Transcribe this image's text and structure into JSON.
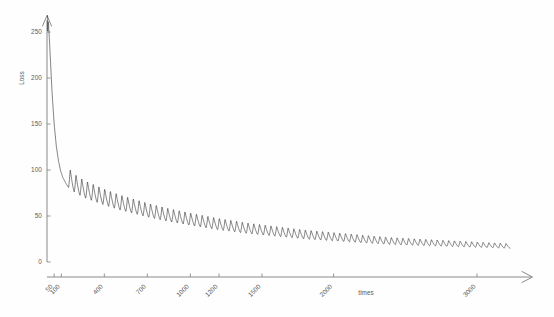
{
  "chart_data": {
    "type": "line",
    "title": "",
    "xlabel": "times",
    "ylabel": "Loss",
    "xlim": [
      0,
      3300
    ],
    "ylim": [
      0,
      262
    ],
    "grid": false,
    "legend": null,
    "series_name": "training loss",
    "line_color": "#2b2b2b",
    "x_ticks": [
      50,
      100,
      400,
      700,
      1000,
      1200,
      1500,
      2000,
      3000
    ],
    "x_tick_labels": [
      "50",
      "100",
      "400",
      "700",
      "1000",
      "1200",
      "1500",
      "2000",
      "3000"
    ],
    "y_ticks": [
      0,
      50,
      100,
      150,
      200,
      250
    ],
    "y_tick_labels": [
      "0",
      "50",
      "100",
      "150",
      "200",
      "250"
    ],
    "oscillation": {
      "present": true,
      "shape": "sawtooth spikes upward",
      "period_iterations": 40,
      "start_iteration": 150,
      "amplitude_start": 22,
      "amplitude_end": 5
    },
    "envelope_points": [
      {
        "x": 10,
        "y": 261
      },
      {
        "x": 20,
        "y": 232
      },
      {
        "x": 35,
        "y": 185
      },
      {
        "x": 50,
        "y": 150
      },
      {
        "x": 65,
        "y": 126
      },
      {
        "x": 80,
        "y": 110
      },
      {
        "x": 95,
        "y": 99
      },
      {
        "x": 110,
        "y": 92
      },
      {
        "x": 130,
        "y": 86
      },
      {
        "x": 150,
        "y": 81
      },
      {
        "x": 200,
        "y": 75
      },
      {
        "x": 260,
        "y": 70
      },
      {
        "x": 330,
        "y": 66
      },
      {
        "x": 400,
        "y": 62
      },
      {
        "x": 500,
        "y": 57
      },
      {
        "x": 600,
        "y": 53
      },
      {
        "x": 700,
        "y": 49
      },
      {
        "x": 850,
        "y": 44
      },
      {
        "x": 1000,
        "y": 40
      },
      {
        "x": 1200,
        "y": 35
      },
      {
        "x": 1400,
        "y": 31
      },
      {
        "x": 1600,
        "y": 28
      },
      {
        "x": 1800,
        "y": 25
      },
      {
        "x": 2000,
        "y": 23
      },
      {
        "x": 2200,
        "y": 21
      },
      {
        "x": 2400,
        "y": 19
      },
      {
        "x": 2600,
        "y": 18
      },
      {
        "x": 2800,
        "y": 17
      },
      {
        "x": 3000,
        "y": 16
      },
      {
        "x": 3200,
        "y": 15
      }
    ]
  },
  "axes": {
    "y_axis_label": "Loss",
    "x_axis_label": "times"
  },
  "colors": {
    "background": "#fefefe",
    "axis": "#8a8a8a",
    "text": "#5a5a5a",
    "curve": "#2b2b2b"
  }
}
